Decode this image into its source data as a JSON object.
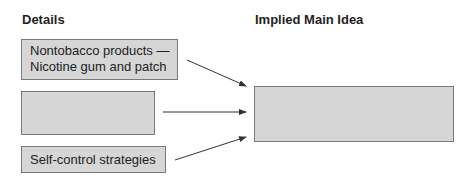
{
  "headings": {
    "details": "Details",
    "main_idea": "Implied Main Idea"
  },
  "details": [
    {
      "line1": "Nontobacco products —",
      "line2": "Nicotine gum and patch"
    },
    {
      "line1": "",
      "line2": ""
    },
    {
      "line1": "Self-control strategies"
    }
  ],
  "main_idea": {
    "text": ""
  },
  "colors": {
    "box_fill": "#d6d6d6",
    "box_border": "#7a7a7a",
    "arrow": "#333333",
    "text": "#1a1a1a"
  }
}
